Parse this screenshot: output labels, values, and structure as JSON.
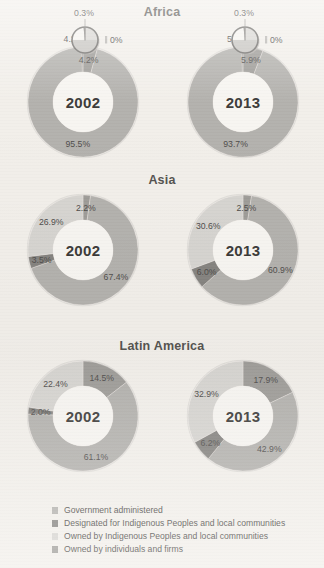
{
  "legend": {
    "items": [
      {
        "label": "Government administered",
        "color": "#b3b1ad"
      },
      {
        "label": "Designated for Indigenous Peoples and local communities",
        "color": "#85837f"
      },
      {
        "label": "Owned by Indigenous Peoples and local communities",
        "color": "#d6d4d0"
      },
      {
        "label": "Owned by individuals and firms",
        "color": "#9e9c98"
      }
    ]
  },
  "regions": [
    {
      "name": "Africa",
      "charts": [
        {
          "year": "2002",
          "labels": [
            "95.5%",
            "0.3%",
            "0%",
            "4.2%"
          ],
          "values": [
            95.5,
            0.3,
            0.0,
            4.2
          ],
          "has_magnifier": true
        },
        {
          "year": "2013",
          "labels": [
            "93.7%",
            "0.3%",
            "0%",
            "5.9%"
          ],
          "values": [
            93.7,
            0.3,
            0.0,
            5.9
          ],
          "has_magnifier": true
        }
      ]
    },
    {
      "name": "Asia",
      "charts": [
        {
          "year": "2002",
          "labels": [
            "67.4%",
            "3.5%",
            "26.9%",
            "2.2%"
          ],
          "values": [
            67.4,
            3.5,
            26.9,
            2.2
          ],
          "has_magnifier": false
        },
        {
          "year": "2013",
          "labels": [
            "60.9%",
            "6.0%",
            "30.6%",
            "2.5%"
          ],
          "values": [
            60.9,
            6.0,
            30.6,
            2.5
          ],
          "has_magnifier": false
        }
      ]
    },
    {
      "name": "Latin America",
      "charts": [
        {
          "year": "2002",
          "labels": [
            "61.1%",
            "2.0%",
            "22.4%",
            "14.5%"
          ],
          "values": [
            61.1,
            2.0,
            22.4,
            14.5
          ],
          "has_magnifier": false
        },
        {
          "year": "2013",
          "labels": [
            "42.9%",
            "6.2%",
            "32.9%",
            "17.9%"
          ],
          "values": [
            42.9,
            6.2,
            32.9,
            17.9
          ],
          "has_magnifier": false
        }
      ]
    }
  ],
  "chart_data": {
    "type": "pie",
    "subtitle": "",
    "xlabel": "",
    "ylabel": "",
    "units": "percent of forest area",
    "legend_position": "bottom",
    "grid": false,
    "categories": [
      "Government administered",
      "Designated for Indigenous Peoples and local communities",
      "Owned by Indigenous Peoples and local communities",
      "Owned by individuals and firms"
    ],
    "colors": [
      "#b3b1ad",
      "#85837f",
      "#d6d4d0",
      "#9e9c98"
    ],
    "charts": [
      {
        "region": "Africa",
        "year": "2002",
        "values": [
          95.5,
          0.3,
          0.0,
          4.2
        ],
        "labels": [
          "95.5%",
          "0.3%",
          "0%",
          "4.2%"
        ]
      },
      {
        "region": "Africa",
        "year": "2013",
        "values": [
          93.7,
          0.3,
          0.0,
          5.9
        ],
        "labels": [
          "93.7%",
          "0.3%",
          "0%",
          "5.9%"
        ]
      },
      {
        "region": "Asia",
        "year": "2002",
        "values": [
          67.4,
          3.5,
          26.9,
          2.2
        ],
        "labels": [
          "67.4%",
          "3.5%",
          "26.9%",
          "2.2%"
        ]
      },
      {
        "region": "Asia",
        "year": "2013",
        "values": [
          60.9,
          6.0,
          30.6,
          2.5
        ],
        "labels": [
          "60.9%",
          "6.0%",
          "30.6%",
          "2.5%"
        ]
      },
      {
        "region": "Latin America",
        "year": "2002",
        "values": [
          61.1,
          2.0,
          22.4,
          14.5
        ],
        "labels": [
          "61.1%",
          "2.0%",
          "22.4%",
          "14.5%"
        ]
      },
      {
        "region": "Latin America",
        "year": "2013",
        "values": [
          42.9,
          6.2,
          32.9,
          17.9
        ],
        "labels": [
          "42.9%",
          "6.2%",
          "32.9%",
          "17.9%"
        ]
      }
    ]
  }
}
